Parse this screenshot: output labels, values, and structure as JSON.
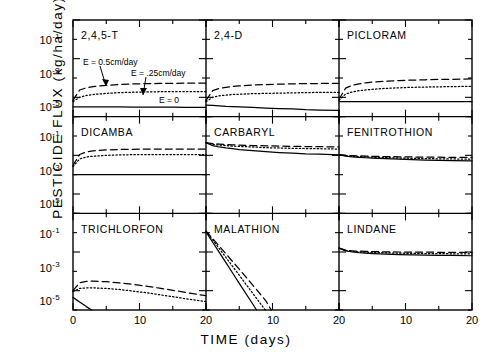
{
  "figure": {
    "ylabel": "PESTICIDE FLUX (kg/ha/day)",
    "xlabel": "TIME (days)",
    "y_ticks": [
      "-1",
      "-3",
      "-5"
    ],
    "y_tick_base": "10",
    "x_ticks": [
      "0",
      "10",
      "20"
    ],
    "annotations": {
      "e_high": "E = 0.5cm/day",
      "e_mid": "E = .25cm/day",
      "e_zero": "E = 0"
    },
    "panel_titles": [
      "2,4,5-T",
      "2,4-D",
      "PICLORAM",
      "DICAMBA",
      "CARBARYL",
      "FENITROTHION",
      "TRICHLORFON",
      "MALATHION",
      "LINDANE"
    ],
    "colors": {
      "ink": "#000000",
      "paper": "#ffffff"
    }
  },
  "chart_data": {
    "type": "line",
    "title": "",
    "xlabel": "TIME (days)",
    "ylabel": "PESTICIDE FLUX (kg/ha/day)",
    "yscale": "log",
    "ylim": [
      1e-06,
      0.1
    ],
    "xlim": [
      0,
      20
    ],
    "y_tick_values": [
      0.1,
      0.001,
      1e-05
    ],
    "y_tick_labels": [
      "10^-1",
      "10^-3",
      "10^-5"
    ],
    "x_tick_values": [
      0,
      10,
      20
    ],
    "x_tick_labels": [
      "0",
      "10",
      "20"
    ],
    "grid": false,
    "legend_position": "inline-annotations",
    "series_styles": [
      {
        "name": "E = 0.5cm/day",
        "dash": "dashed"
      },
      {
        "name": "E = .25cm/day",
        "dash": "dotted"
      },
      {
        "name": "E = 0",
        "dash": "solid"
      }
    ],
    "x": [
      0,
      1,
      2,
      3,
      4,
      5,
      7,
      9,
      11,
      13,
      15,
      17,
      20
    ],
    "panels": [
      {
        "title": "2,4,5-T",
        "series": [
          {
            "name": "E = 0.5cm/day",
            "values": [
              7e-06,
              2.4e-05,
              3.1e-05,
              3.6e-05,
              3.9e-05,
              4.2e-05,
              4.6e-05,
              4.9e-05,
              5.1e-05,
              5.2e-05,
              5.3e-05,
              5.4e-05,
              5.5e-05
            ]
          },
          {
            "name": "E = .25cm/day",
            "values": [
              6e-06,
              1e-05,
              1.25e-05,
              1.4e-05,
              1.5e-05,
              1.6e-05,
              1.75e-05,
              1.85e-05,
              1.9e-05,
              1.95e-05,
              2e-05,
              2e-05,
              2e-05
            ]
          },
          {
            "name": "E = 0",
            "values": [
              3.2e-06,
              3.2e-06,
              3.2e-06,
              3.2e-06,
              3.2e-06,
              3.2e-06,
              3.2e-06,
              3.1e-06,
              3.1e-06,
              3.1e-06,
              3.1e-06,
              3e-06,
              3e-06
            ]
          }
        ]
      },
      {
        "title": "2,4-D",
        "series": [
          {
            "name": "E = 0.5cm/day",
            "values": [
              7e-06,
              2.2e-05,
              2.9e-05,
              3.3e-05,
              3.6e-05,
              3.9e-05,
              4.3e-05,
              4.6e-05,
              4.8e-05,
              5e-05,
              5.1e-05,
              5.2e-05,
              5.3e-05
            ]
          },
          {
            "name": "E = .25cm/day",
            "values": [
              6e-06,
              1e-05,
              1.2e-05,
              1.3e-05,
              1.4e-05,
              1.45e-05,
              1.55e-05,
              1.6e-05,
              1.65e-05,
              1.7e-05,
              1.75e-05,
              1.8e-05,
              1.8e-05
            ]
          },
          {
            "name": "E = 0",
            "values": [
              4e-06,
              3.8e-06,
              3.6e-06,
              3.4e-06,
              3.3e-06,
              3.2e-06,
              3e-06,
              2.8e-06,
              2.6e-06,
              2.5e-06,
              2.3e-06,
              2.2e-06,
              2.1e-06
            ]
          }
        ]
      },
      {
        "title": "PICLORAM",
        "series": [
          {
            "name": "E = 0.5cm/day",
            "values": [
              8e-06,
              3e-05,
              4.2e-05,
              5e-05,
              5.6e-05,
              6.1e-05,
              6.8e-05,
              7.4e-05,
              7.8e-05,
              8.1e-05,
              8.4e-05,
              8.6e-05,
              8.9e-05
            ]
          },
          {
            "name": "E = .25cm/day",
            "values": [
              7e-06,
              1.5e-05,
              1.9e-05,
              2.2e-05,
              2.4e-05,
              2.6e-05,
              2.9e-05,
              3.1e-05,
              3.3e-05,
              3.4e-05,
              3.5e-05,
              3.6e-05,
              3.7e-05
            ]
          },
          {
            "name": "E = 0",
            "values": [
              6e-06,
              6e-06,
              6e-06,
              6e-06,
              6e-06,
              6e-06,
              6e-06,
              6e-06,
              6e-06,
              6e-06,
              6e-06,
              6e-06,
              6e-06
            ]
          }
        ]
      },
      {
        "title": "DICAMBA",
        "series": [
          {
            "name": "E = 0.5cm/day",
            "values": [
              0.0003,
              0.0011,
              0.0015,
              0.0017,
              0.0018,
              0.0019,
              0.002,
              0.00205,
              0.0021,
              0.0021,
              0.0021,
              0.0021,
              0.0021
            ]
          },
          {
            "name": "E = .25cm/day",
            "values": [
              0.00026,
              0.00065,
              0.00082,
              0.0009,
              0.00095,
              0.001,
              0.00105,
              0.00108,
              0.0011,
              0.0011,
              0.0011,
              0.0011,
              0.0011
            ]
          },
          {
            "name": "E = 0",
            "values": [
              0.0001,
              0.0001,
              0.0001,
              0.0001,
              0.0001,
              0.0001,
              0.0001,
              0.0001,
              0.0001,
              0.0001,
              0.0001,
              0.0001,
              0.0001
            ]
          }
        ]
      },
      {
        "title": "CARBARYL",
        "series": [
          {
            "name": "E = 0.5cm/day",
            "values": [
              0.0045,
              0.004,
              0.0038,
              0.0036,
              0.0035,
              0.0034,
              0.0032,
              0.0031,
              0.003,
              0.0029,
              0.00285,
              0.0028,
              0.0027
            ]
          },
          {
            "name": "E = .25cm/day",
            "values": [
              0.0045,
              0.0037,
              0.0034,
              0.0032,
              0.003,
              0.0029,
              0.0027,
              0.0025,
              0.0024,
              0.0023,
              0.00225,
              0.0022,
              0.0021
            ]
          },
          {
            "name": "E = 0",
            "values": [
              0.0045,
              0.0032,
              0.0027,
              0.0024,
              0.0022,
              0.002,
              0.00175,
              0.00155,
              0.0014,
              0.0013,
              0.0012,
              0.00115,
              0.00105
            ]
          }
        ]
      },
      {
        "title": "FENITROTHION",
        "series": [
          {
            "name": "E = 0.5cm/day",
            "values": [
              0.0011,
              0.001,
              0.00096,
              0.00093,
              0.00091,
              0.00089,
              0.00086,
              0.00084,
              0.00082,
              0.00081,
              0.0008,
              0.00079,
              0.00078
            ]
          },
          {
            "name": "E = .25cm/day",
            "values": [
              0.0011,
              0.00096,
              0.0009,
              0.00086,
              0.00083,
              0.0008,
              0.00076,
              0.00073,
              0.0007,
              0.00068,
              0.00066,
              0.00065,
              0.00063
            ]
          },
          {
            "name": "E = 0",
            "values": [
              0.0011,
              0.00092,
              0.00084,
              0.00079,
              0.00075,
              0.00072,
              0.00067,
              0.00063,
              0.0006,
              0.00057,
              0.00055,
              0.00053,
              0.00051
            ]
          }
        ]
      },
      {
        "title": "TRICHLORFON",
        "series": [
          {
            "name": "E = 0.5cm/day",
            "values": [
              1e-05,
              2.6e-05,
              3e-05,
              3.1e-05,
              3e-05,
              2.9e-05,
              2.5e-05,
              2.1e-05,
              1.7e-05,
              1.35e-05,
              1.05e-05,
              8e-06,
              5.5e-06
            ]
          },
          {
            "name": "E = .25cm/day",
            "values": [
              9e-06,
              1.3e-05,
              1.4e-05,
              1.4e-05,
              1.35e-05,
              1.3e-05,
              1.15e-05,
              9.5e-06,
              7.8e-06,
              6.2e-06,
              4.9e-06,
              3.8e-06,
              2.7e-06
            ]
          },
          {
            "name": "E = 0",
            "values": [
              4.5e-06,
              2.6e-06,
              1.5e-06,
              9e-07,
              5e-07,
              3e-07,
              1e-07,
              0,
              0,
              0,
              0,
              0,
              0
            ]
          }
        ]
      },
      {
        "title": "MALATHION",
        "series": [
          {
            "name": "E = 0.5cm/day",
            "values": [
              0.012,
              0.005,
              0.002,
              0.0008,
              0.00032,
              0.00013,
              2e-05,
              3e-06,
              2e-07,
              0,
              0,
              0,
              0
            ]
          },
          {
            "name": "E = .25cm/day",
            "values": [
              0.012,
              0.0042,
              0.0015,
              0.00052,
              0.00018,
              6.3e-05,
              7.5e-06,
              9e-07,
              0,
              0,
              0,
              0,
              0
            ]
          },
          {
            "name": "E = 0",
            "values": [
              0.011,
              0.0032,
              0.00095,
              0.00028,
              8.2e-05,
              2.4e-05,
              2.1e-06,
              1.8e-07,
              0,
              0,
              0,
              0,
              0
            ]
          }
        ]
      },
      {
        "title": "LINDANE",
        "series": [
          {
            "name": "E = 0.5cm/day",
            "values": [
              0.0016,
              0.00125,
              0.00115,
              0.0011,
              0.00108,
              0.00105,
              0.00102,
              0.001,
              0.00099,
              0.00098,
              0.00097,
              0.00096,
              0.00095
            ]
          },
          {
            "name": "E = .25cm/day",
            "values": [
              0.0016,
              0.0012,
              0.00108,
              0.00102,
              0.00098,
              0.00095,
              0.0009,
              0.00087,
              0.00085,
              0.00083,
              0.00082,
              0.00081,
              0.0008
            ]
          },
          {
            "name": "E = 0",
            "values": [
              0.0016,
              0.00115,
              0.001,
              0.00092,
              0.00087,
              0.00083,
              0.00078,
              0.00074,
              0.00071,
              0.00069,
              0.00067,
              0.00066,
              0.00064
            ]
          }
        ]
      }
    ]
  }
}
